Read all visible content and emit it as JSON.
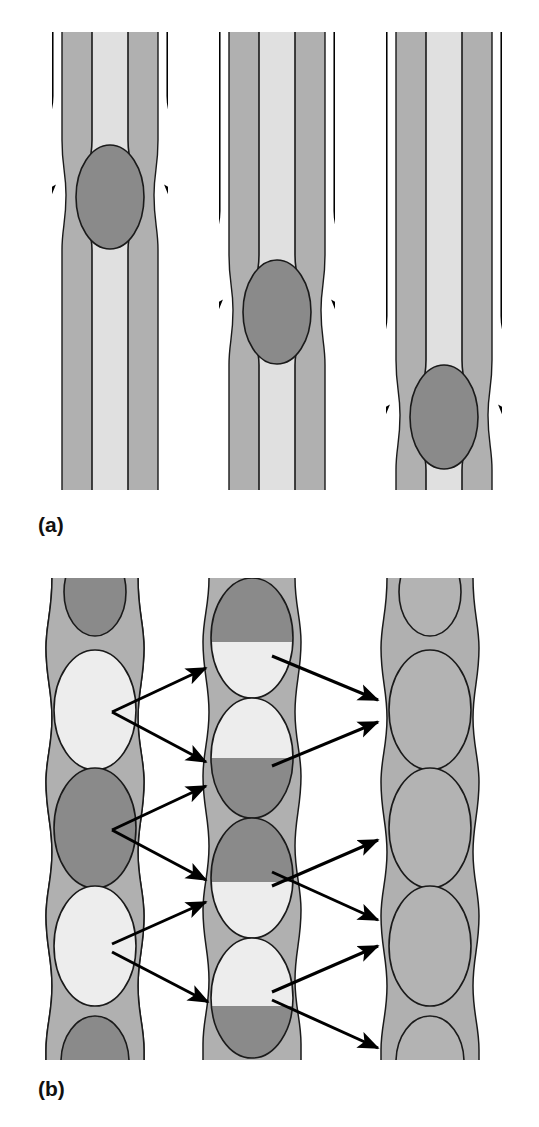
{
  "figure": {
    "title": "",
    "type": "scientific-schematic",
    "width": 539,
    "height": 1127,
    "background": "#ffffff"
  },
  "colors": {
    "wall_gray": "#b0b0b0",
    "lumen_light": "#e0e0e0",
    "ellipse_dark": "#8a8a8a",
    "ellipse_light": "#ededed",
    "ellipse_mixed": "#b3b3b3",
    "outline": "#1a1a1a",
    "arrow": "#000000",
    "label_text": "#111111"
  },
  "panels": [
    {
      "id": "a",
      "label": "(a)",
      "label_x": 38,
      "label_y": 513,
      "description": "Three sequential stages of a deformable particle translating downward through a straight channel with a constriction; streamlines diverge around the particle.",
      "stages": [
        {
          "name": "stage-1",
          "center_x": 110,
          "channel_left": 62,
          "channel_right": 158,
          "constriction_y": 140,
          "particle_cy": 195,
          "particle_rx": 34,
          "particle_ry": 52,
          "particle_fill": "ellipse_dark",
          "arrow_tip_y": 205,
          "arrow_label": "flow-streamline"
        },
        {
          "name": "stage-2",
          "center_x": 277,
          "channel_left": 229,
          "channel_right": 325,
          "constriction_y": 255,
          "particle_cy": 310,
          "particle_rx": 34,
          "particle_ry": 52,
          "particle_fill": "ellipse_dark",
          "arrow_tip_y": 320,
          "arrow_label": "flow-streamline"
        },
        {
          "name": "stage-3",
          "center_x": 444,
          "channel_left": 396,
          "channel_right": 492,
          "constriction_y": 360,
          "particle_cy": 415,
          "particle_rx": 34,
          "particle_ry": 52,
          "particle_fill": "ellipse_dark",
          "arrow_tip_y": 425,
          "arrow_label": "flow-streamline"
        }
      ]
    },
    {
      "id": "b",
      "label": "(b)",
      "label_x": 38,
      "label_y": 1077,
      "description": "Three columns of a periodic bulge-and-throat pore chain. Left column holds alternating pure light and pure dark fluid bodies; middle column shows each body split into a dark half and a light half after displacement; right column shows fully blended uniform gray bodies. Arrows map each source body onto two downstream bodies.",
      "columns": [
        {
          "name": "column-left",
          "center_x": 95,
          "bulge_rx": 46,
          "throat_rx": 16,
          "label": "segregated",
          "bodies": [
            {
              "cy": 600,
              "fill": "ellipse_dark",
              "split": "none"
            },
            {
              "cy": 702,
              "fill": "ellipse_light",
              "split": "none"
            },
            {
              "cy": 822,
              "fill": "ellipse_dark",
              "split": "none"
            },
            {
              "cy": 942,
              "fill": "ellipse_light",
              "split": "none"
            },
            {
              "cy": 1052,
              "fill": "ellipse_dark",
              "split": "none"
            }
          ]
        },
        {
          "name": "column-middle",
          "center_x": 252,
          "bulge_rx": 46,
          "throat_rx": 16,
          "label": "partially-mixed",
          "bodies": [
            {
              "cy": 640,
              "fill_top": "ellipse_dark",
              "fill_bottom": "ellipse_light",
              "split": "horizontal"
            },
            {
              "cy": 760,
              "fill_top": "ellipse_light",
              "fill_bottom": "ellipse_dark",
              "split": "horizontal"
            },
            {
              "cy": 880,
              "fill_top": "ellipse_dark",
              "fill_bottom": "ellipse_light",
              "split": "horizontal"
            },
            {
              "cy": 1000,
              "fill_top": "ellipse_light",
              "fill_bottom": "ellipse_dark",
              "split": "horizontal"
            }
          ]
        },
        {
          "name": "column-right",
          "center_x": 430,
          "bulge_rx": 46,
          "throat_rx": 16,
          "label": "fully-mixed",
          "bodies": [
            {
              "cy": 600,
              "fill": "ellipse_mixed",
              "split": "none"
            },
            {
              "cy": 702,
              "fill": "ellipse_mixed",
              "split": "none"
            },
            {
              "cy": 822,
              "fill": "ellipse_mixed",
              "split": "none"
            },
            {
              "cy": 942,
              "fill": "ellipse_mixed",
              "split": "none"
            },
            {
              "cy": 1052,
              "fill": "ellipse_mixed",
              "split": "none"
            }
          ]
        }
      ],
      "mapping_arrows": [
        {
          "name": "arrow-l1-m1",
          "x1": 128,
          "y1": 712,
          "x2": 210,
          "y2": 672
        },
        {
          "name": "arrow-l1-m2",
          "x1": 128,
          "y1": 712,
          "x2": 210,
          "y2": 760
        },
        {
          "name": "arrow-l2-m2",
          "x1": 128,
          "y1": 828,
          "x2": 210,
          "y2": 788
        },
        {
          "name": "arrow-l2-m3",
          "x1": 128,
          "y1": 828,
          "x2": 210,
          "y2": 876
        },
        {
          "name": "arrow-l3-m4",
          "x1": 128,
          "y1": 944,
          "x2": 210,
          "y2": 906
        },
        {
          "name": "arrow-l3-m5",
          "x1": 128,
          "y1": 950,
          "x2": 212,
          "y2": 1000
        },
        {
          "name": "arrow-m1-r1",
          "x1": 286,
          "y1": 660,
          "x2": 372,
          "y2": 700
        },
        {
          "name": "arrow-m2-r2",
          "x1": 286,
          "y1": 768,
          "x2": 372,
          "y2": 724
        },
        {
          "name": "arrow-m3-r3",
          "x1": 286,
          "y1": 884,
          "x2": 372,
          "y2": 838
        },
        {
          "name": "arrow-m4-r4",
          "x1": 286,
          "y1": 872,
          "x2": 372,
          "y2": 918
        },
        {
          "name": "arrow-m5-r5",
          "x1": 286,
          "y1": 990,
          "x2": 372,
          "y2": 944
        },
        {
          "name": "arrow-m6-r6",
          "x1": 286,
          "y1": 1000,
          "x2": 372,
          "y2": 1048
        }
      ]
    }
  ]
}
